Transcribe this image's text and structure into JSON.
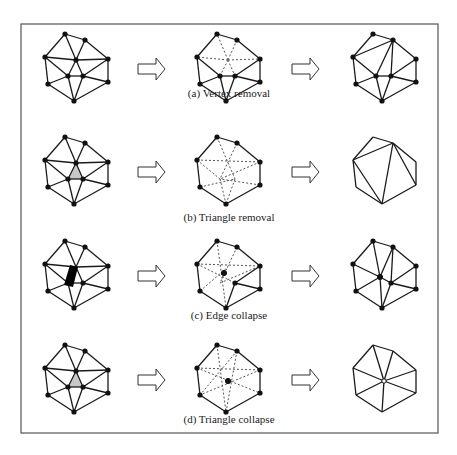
{
  "figure": {
    "frame": {
      "x": 21,
      "y": 24,
      "w": 417,
      "h": 409,
      "stroke": "#555555"
    },
    "colors": {
      "line": "#1a1a1a",
      "vertex": "#111111",
      "shade": "#c8c8c8",
      "dash": "#555555"
    },
    "rows": [
      {
        "id": "a",
        "caption": "(a) Vertex removal",
        "y": 0
      },
      {
        "id": "b",
        "caption": "(b) Triangle removal",
        "y": 103
      },
      {
        "id": "c",
        "caption": "(c) Edge collapse",
        "y": 207
      },
      {
        "id": "d",
        "caption": "(d) Triangle collapse",
        "y": 311
      }
    ],
    "arrow_icon": "right-outline-arrow-icon"
  }
}
